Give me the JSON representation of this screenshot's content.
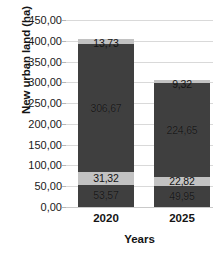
{
  "chart_data": {
    "type": "bar",
    "subtype": "stacked-column",
    "title": "",
    "xlabel": "Years",
    "ylabel": "New urban land (ha)",
    "categories": [
      "2020",
      "2025"
    ],
    "ylim": [
      0,
      450
    ],
    "ytick_step": 50,
    "ytick_labels": [
      "450,00",
      "400,00",
      "350,00",
      "300,00",
      "250,00",
      "200,00",
      "150,00",
      "100,00",
      "50,00",
      "0,00"
    ],
    "ytick_values": [
      450,
      400,
      350,
      300,
      250,
      200,
      150,
      100,
      50,
      0
    ],
    "grid": true,
    "legend": false,
    "legend_position": "none",
    "decimal_separator": ",",
    "series": [
      {
        "name": "segment-1",
        "color": "#3f3f3f",
        "values": [
          53.57,
          49.95
        ],
        "labels": [
          "53,57",
          "49,95"
        ]
      },
      {
        "name": "segment-2",
        "color": "#c2c2c2",
        "values": [
          31.32,
          22.82
        ],
        "labels": [
          "31,32",
          "22,82"
        ]
      },
      {
        "name": "segment-3",
        "color": "#3f3f3f",
        "values": [
          306.67,
          224.65
        ],
        "labels": [
          "306,67",
          "224,65"
        ]
      },
      {
        "name": "segment-4",
        "color": "#c2c2c2",
        "values": [
          13.73,
          9.32
        ],
        "labels": [
          "13,73",
          "9,32"
        ]
      }
    ],
    "totals": [
      405.29,
      306.74
    ]
  },
  "axes": {
    "y_title": "New urban land (ha)",
    "x_title": "Years",
    "y_ticks": [
      {
        "label": "450,00"
      },
      {
        "label": "400,00"
      },
      {
        "label": "350,00"
      },
      {
        "label": "300,00"
      },
      {
        "label": "250,00"
      },
      {
        "label": "200,00"
      },
      {
        "label": "150,00"
      },
      {
        "label": "100,00"
      },
      {
        "label": "50,00"
      },
      {
        "label": "0,00"
      }
    ],
    "x_ticks": [
      {
        "label": "2020"
      },
      {
        "label": "2025"
      }
    ]
  },
  "bars": [
    {
      "category": "2020",
      "segments": [
        {
          "label": "53,57",
          "value": 53.57,
          "tone": "dark"
        },
        {
          "label": "31,32",
          "value": 31.32,
          "tone": "light"
        },
        {
          "label": "306,67",
          "value": 306.67,
          "tone": "dark"
        },
        {
          "label": "13,73",
          "value": 13.73,
          "tone": "light"
        }
      ]
    },
    {
      "category": "2025",
      "segments": [
        {
          "label": "49,95",
          "value": 49.95,
          "tone": "dark"
        },
        {
          "label": "22,82",
          "value": 22.82,
          "tone": "light"
        },
        {
          "label": "224,65",
          "value": 224.65,
          "tone": "dark"
        },
        {
          "label": "9,32",
          "value": 9.32,
          "tone": "light"
        }
      ]
    }
  ],
  "colors": {
    "dark_segment": "#3f3f3f",
    "light_segment": "#c2c2c2",
    "gridline": "#d9d9d9",
    "text": "#141414",
    "background": "#ffffff"
  }
}
